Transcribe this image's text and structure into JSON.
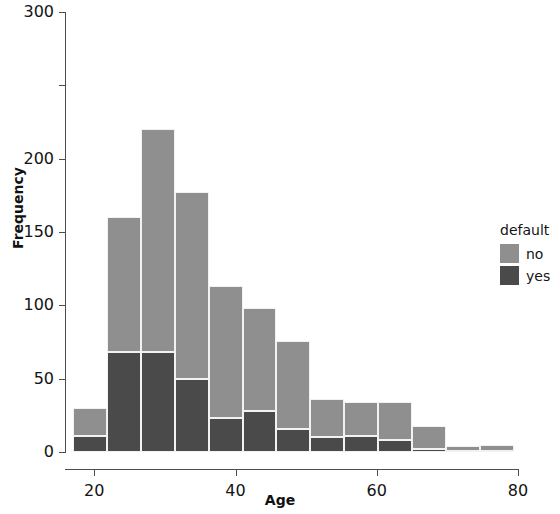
{
  "chart_data": {
    "type": "bar",
    "stacked": true,
    "title": "",
    "xlabel": "Age",
    "ylabel": "Frequency",
    "xlim": [
      16,
      80
    ],
    "ylim": [
      0,
      300
    ],
    "xticks": [
      20,
      40,
      60,
      80
    ],
    "yticks": [
      0,
      50,
      100,
      150,
      200,
      250,
      300
    ],
    "ytick_labels": [
      "0",
      "50",
      "100",
      "150",
      "200",
      "300"
    ],
    "grid": false,
    "legend": {
      "title": "default",
      "position": "right",
      "entries": [
        {
          "label": "no",
          "color": "#8f8f8f"
        },
        {
          "label": "yes",
          "color": "#4a4a4a"
        }
      ]
    },
    "bin_width": 4.8,
    "bin_starts": [
      17.0,
      21.8,
      26.6,
      31.4,
      36.2,
      41.0,
      45.8,
      50.6,
      55.4,
      60.2,
      65.0,
      69.8,
      74.6
    ],
    "categories": [
      "17-22",
      "22-27",
      "27-31",
      "31-36",
      "36-41",
      "41-46",
      "46-51",
      "51-55",
      "55-60",
      "60-65",
      "65-70",
      "70-75",
      "75-79"
    ],
    "series": [
      {
        "name": "yes",
        "color": "#4a4a4a",
        "values": [
          11,
          68,
          68,
          50,
          23,
          28,
          16,
          10,
          11,
          8,
          2,
          1,
          1
        ]
      },
      {
        "name": "no",
        "color": "#8f8f8f",
        "values": [
          19,
          92,
          152,
          127,
          90,
          70,
          60,
          26,
          23,
          26,
          16,
          3,
          4
        ]
      }
    ],
    "totals": [
      30,
      160,
      220,
      177,
      113,
      98,
      76,
      36,
      34,
      34,
      18,
      4,
      5
    ]
  },
  "axes": {
    "x_title": "Age",
    "y_title": "Frequency"
  }
}
